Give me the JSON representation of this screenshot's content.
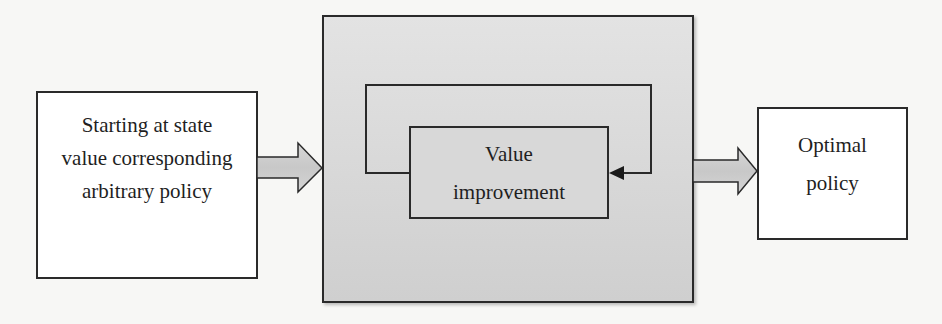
{
  "diagram": {
    "type": "flowchart",
    "nodes": [
      {
        "id": "start",
        "label": "Starting at state\nvalue corresponding\narbitrary policy"
      },
      {
        "id": "process",
        "label": ""
      },
      {
        "id": "value_improvement",
        "label": "Value\nimprovement"
      },
      {
        "id": "end",
        "label": "Optimal\npolicy"
      }
    ],
    "edges": [
      {
        "from": "start",
        "to": "process",
        "style": "block-arrow"
      },
      {
        "from": "value_improvement",
        "to": "value_improvement",
        "style": "feedback-loop"
      },
      {
        "from": "process",
        "to": "end",
        "style": "block-arrow"
      }
    ]
  },
  "colors": {
    "background": "#f7f7f5",
    "box_border": "#2a2a2a",
    "process_fill": "#d9d9d9",
    "arrow_fill": "#cfcfcf",
    "text": "#1f1f1f"
  }
}
